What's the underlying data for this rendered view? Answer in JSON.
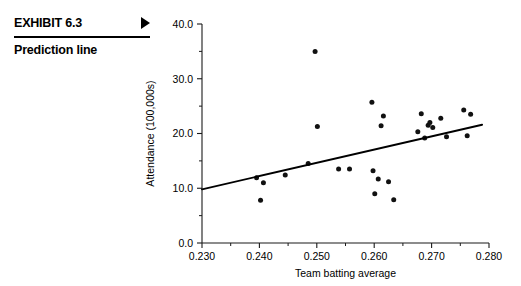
{
  "exhibit": {
    "number_label": "EXHIBIT 6.3",
    "subtitle": "Prediction line",
    "arrow_icon": "triangle-right-icon"
  },
  "chart_data": {
    "type": "scatter",
    "title": "",
    "xlabel": "Team batting average",
    "ylabel": "Attendance (100,000s)",
    "xlim": [
      0.23,
      0.28
    ],
    "ylim": [
      0.0,
      40.0
    ],
    "xticks": [
      0.23,
      0.24,
      0.25,
      0.26,
      0.27,
      0.28
    ],
    "xtick_labels": [
      "0.230",
      "0.240",
      "0.250",
      "0.260",
      "0.270",
      "0.280"
    ],
    "xminor_ticks": [
      0.235,
      0.245,
      0.255,
      0.265,
      0.275
    ],
    "yticks": [
      0.0,
      10.0,
      20.0,
      30.0,
      40.0
    ],
    "ytick_labels": [
      "0.0",
      "10.0",
      "20.0",
      "30.0",
      "40.0"
    ],
    "yminor_ticks": [
      5.0,
      15.0,
      25.0,
      35.0
    ],
    "grid": false,
    "legend": false,
    "marker": "filled-circle",
    "marker_color": "#111111",
    "points": [
      {
        "x": 0.2395,
        "y": 11.9
      },
      {
        "x": 0.2402,
        "y": 7.8
      },
      {
        "x": 0.2407,
        "y": 11.0
      },
      {
        "x": 0.2445,
        "y": 12.4
      },
      {
        "x": 0.2485,
        "y": 14.5
      },
      {
        "x": 0.2497,
        "y": 35.0
      },
      {
        "x": 0.2501,
        "y": 21.3
      },
      {
        "x": 0.2538,
        "y": 13.5
      },
      {
        "x": 0.2557,
        "y": 13.5
      },
      {
        "x": 0.2596,
        "y": 25.7
      },
      {
        "x": 0.2598,
        "y": 13.2
      },
      {
        "x": 0.2601,
        "y": 9.0
      },
      {
        "x": 0.2607,
        "y": 11.7
      },
      {
        "x": 0.2612,
        "y": 21.4
      },
      {
        "x": 0.2616,
        "y": 23.2
      },
      {
        "x": 0.2625,
        "y": 11.2
      },
      {
        "x": 0.2634,
        "y": 7.9
      },
      {
        "x": 0.2676,
        "y": 20.3
      },
      {
        "x": 0.2682,
        "y": 23.6
      },
      {
        "x": 0.2688,
        "y": 19.2
      },
      {
        "x": 0.2694,
        "y": 21.5
      },
      {
        "x": 0.2697,
        "y": 22.0
      },
      {
        "x": 0.2702,
        "y": 21.1
      },
      {
        "x": 0.2716,
        "y": 22.8
      },
      {
        "x": 0.2726,
        "y": 19.4
      },
      {
        "x": 0.2756,
        "y": 24.3
      },
      {
        "x": 0.2762,
        "y": 19.6
      },
      {
        "x": 0.2768,
        "y": 23.5
      }
    ],
    "regression_line": {
      "label": "Prediction line",
      "x_start": 0.23,
      "y_start": 9.8,
      "x_end": 0.2788,
      "y_end": 21.6
    }
  }
}
